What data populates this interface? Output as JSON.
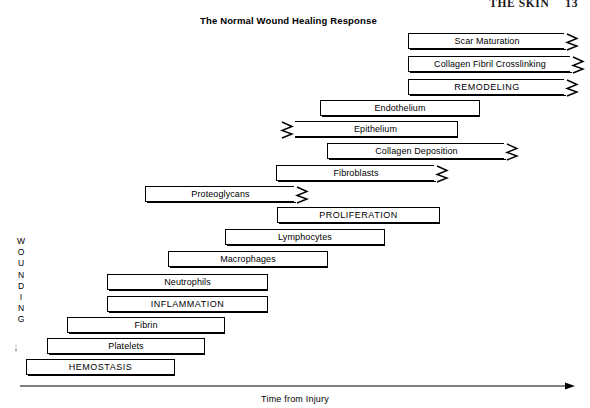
{
  "page_header": {
    "title": "THE SKIN",
    "page_number": "13"
  },
  "figure": {
    "title": "The Normal Wound Healing Response",
    "x_axis": {
      "label": "Time from Injury",
      "arrow": "right-arrow-icon"
    },
    "y_axis": {
      "label": "WOUNDING",
      "letters": [
        "W",
        "O",
        "U",
        "N",
        "D",
        "I",
        "N",
        "G"
      ],
      "arrow": "down-arrow-icon"
    }
  },
  "chart_data": {
    "type": "bar",
    "orientation": "horizontal",
    "title": "The Normal Wound Healing Response",
    "xlabel": "Time from Injury",
    "ylabel": "WOUNDING",
    "grid": false,
    "legend": null,
    "note": "Gantt-style timeline. x positions are pixel coordinates across the 590px figure; 'continues' means a zigzag break indicating the process extends beyond the drawn edge.",
    "categories": [
      "Scar Maturation",
      "Collagen Fibril Crosslinking",
      "REMODELING",
      "Endothelium",
      "Epithelium",
      "Collagen Deposition",
      "Fibroblasts",
      "Proteoglycans",
      "PROLIFERATION",
      "Lymphocytes",
      "Macrophages",
      "Neutrophils",
      "INFLAMMATION",
      "Fibrin",
      "Platelets",
      "HEMOSTASIS"
    ],
    "bars": [
      {
        "label": "Scar Maturation",
        "kind": "process",
        "top": 33,
        "start": 408,
        "end": 566,
        "break_right": true,
        "break_left": false
      },
      {
        "label": "Collagen Fibril Crosslinking",
        "kind": "process",
        "top": 56,
        "start": 408,
        "end": 572,
        "break_right": true,
        "break_left": false
      },
      {
        "label": "REMODELING",
        "kind": "phase",
        "top": 79,
        "start": 408,
        "end": 566,
        "break_right": true,
        "break_left": false
      },
      {
        "label": "Endothelium",
        "kind": "process",
        "top": 100,
        "start": 320,
        "end": 480,
        "break_right": false,
        "break_left": false
      },
      {
        "label": "Epithelium",
        "kind": "process",
        "top": 121,
        "start": 293,
        "end": 458,
        "break_right": false,
        "break_left": true
      },
      {
        "label": "Collagen Deposition",
        "kind": "process",
        "top": 143,
        "start": 327,
        "end": 506,
        "break_right": true,
        "break_left": false
      },
      {
        "label": "Fibroblasts",
        "kind": "process",
        "top": 165,
        "start": 276,
        "end": 436,
        "break_right": true,
        "break_left": false
      },
      {
        "label": "Proteoglycans",
        "kind": "process",
        "top": 186,
        "start": 145,
        "end": 296,
        "break_right": true,
        "break_left": false
      },
      {
        "label": "PROLIFERATION",
        "kind": "phase",
        "top": 207,
        "start": 277,
        "end": 440,
        "break_right": false,
        "break_left": false
      },
      {
        "label": "Lymphocytes",
        "kind": "process",
        "top": 229,
        "start": 225,
        "end": 385,
        "break_right": false,
        "break_left": false
      },
      {
        "label": "Macrophages",
        "kind": "process",
        "top": 251,
        "start": 168,
        "end": 328,
        "break_right": false,
        "break_left": false
      },
      {
        "label": "Neutrophils",
        "kind": "process",
        "top": 274,
        "start": 107,
        "end": 268,
        "break_right": false,
        "break_left": false
      },
      {
        "label": "INFLAMMATION",
        "kind": "phase",
        "top": 296,
        "start": 107,
        "end": 268,
        "break_right": false,
        "break_left": false
      },
      {
        "label": "Fibrin",
        "kind": "process",
        "top": 317,
        "start": 67,
        "end": 225,
        "break_right": false,
        "break_left": false
      },
      {
        "label": "Platelets",
        "kind": "process",
        "top": 338,
        "start": 47,
        "end": 205,
        "break_right": false,
        "break_left": false
      },
      {
        "label": "HEMOSTASIS",
        "kind": "phase",
        "top": 359,
        "start": 26,
        "end": 175,
        "break_right": false,
        "break_left": false
      }
    ]
  },
  "colors": {
    "ink": "#000000",
    "paper": "#ffffff"
  }
}
